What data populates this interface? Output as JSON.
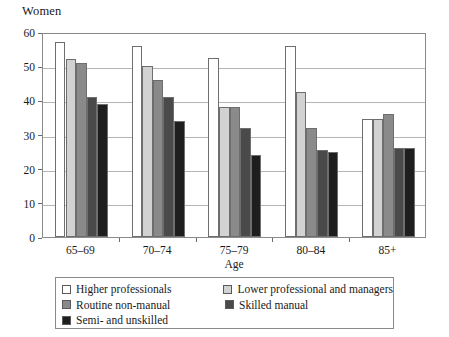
{
  "chart_data": {
    "type": "bar",
    "title": "Women",
    "xlabel": "Age",
    "ylabel": "",
    "ylim": [
      0,
      60
    ],
    "yticks": [
      0,
      10,
      20,
      30,
      40,
      50,
      60
    ],
    "grid": true,
    "legend_position": "bottom",
    "categories": [
      "65–69",
      "70–74",
      "75–79",
      "80–84",
      "85+"
    ],
    "series": [
      {
        "name": "Higher professionals",
        "color": "#ffffff",
        "values": [
          57,
          56,
          52.5,
          56,
          34.5
        ]
      },
      {
        "name": "Lower professional and managers",
        "color": "#d2d2d2",
        "values": [
          52,
          50,
          38,
          42.5,
          34.5
        ]
      },
      {
        "name": "Routine non-manual",
        "color": "#8a8a8a",
        "values": [
          51,
          46,
          38,
          32,
          36
        ]
      },
      {
        "name": "Skilled manual",
        "color": "#4a4a4a",
        "values": [
          41,
          41,
          32,
          25.5,
          26
        ]
      },
      {
        "name": "Semi- and unskilled",
        "color": "#1e1e1e",
        "values": [
          39,
          34,
          24,
          25,
          26
        ]
      }
    ]
  }
}
